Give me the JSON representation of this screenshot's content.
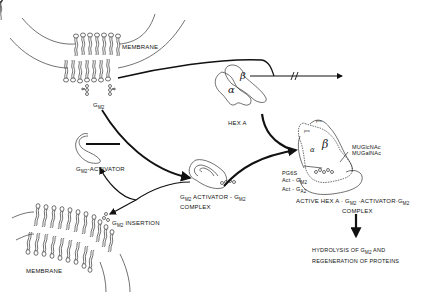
{
  "diagram": {
    "type": "biochemical pathway",
    "nodes": {
      "membrane_top": {
        "label": "MEMBRANE"
      },
      "gm2": {
        "label": "G",
        "sub": "M2"
      },
      "hexa": {
        "label": "HEX A",
        "alpha": "α",
        "beta": "β"
      },
      "activator": {
        "label_g": "G",
        "label_sub": "M2",
        "label_rest": "-ACTIVATOR"
      },
      "complex": {
        "line1_g": "G",
        "line1_sub": "M2",
        "line1_mid": " ACTIVATOR - G",
        "line1_sub2": "M2",
        "line2": "COMPLEX"
      },
      "insertion": {
        "label_g": "G",
        "label_sub": "M2",
        "label_rest": " INSERTION"
      },
      "membrane_bottom": {
        "label": "MEMBRANE"
      },
      "active_complex": {
        "line1_pre": "ACTIVE HEX A · G",
        "line1_sub": "M2",
        "line1_mid": " ·ACTIVATOR·G",
        "line1_sub2": "M2",
        "line2": "COMPLEX",
        "pro1": "pro",
        "pro2": "pro",
        "alpha": "α",
        "beta": "β"
      },
      "substrates": {
        "line1": "MUGlcNAc",
        "line2": "MUGalNAc"
      },
      "inhibitors": {
        "line1": "PG6S",
        "line2_pre": "Act - G",
        "line2_sub": "M2",
        "line3_pre": "Act - G",
        "line3_sub": "A2"
      },
      "result": {
        "line1_pre": "HYDROLYSIS  OF  G",
        "line1_sub": "M2",
        "line1_post": "  AND",
        "line2": "REGENERATION  OF  PROTEINS"
      }
    },
    "edges": [
      {
        "from": "membrane_top",
        "to": "blocked",
        "style": "interrupted arrow"
      },
      {
        "from": "gm2",
        "to": "complex"
      },
      {
        "from": "activator",
        "to": "complex"
      },
      {
        "from": "complex",
        "to": "active_complex"
      },
      {
        "from": "complex",
        "to": "activator"
      },
      {
        "from": "complex",
        "to": "insertion"
      },
      {
        "from": "hexa",
        "to": "active_complex"
      },
      {
        "from": "active_complex",
        "to": "result"
      }
    ]
  }
}
